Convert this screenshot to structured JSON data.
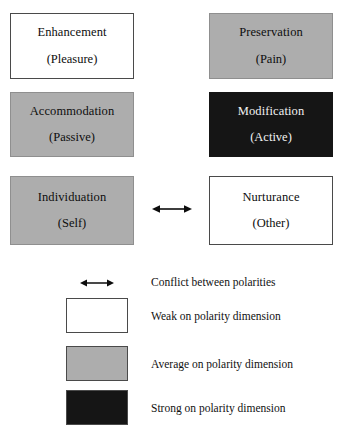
{
  "diagram": {
    "matrix": {
      "rows": [
        {
          "left": {
            "title": "Enhancement",
            "sub": "(Pleasure)",
            "fill": "weak",
            "fill_color": "#ffffff"
          },
          "right": {
            "title": "Preservation",
            "sub": "(Pain)",
            "fill": "average",
            "fill_color": "#adadad"
          }
        },
        {
          "left": {
            "title": "Accommodation",
            "sub": "(Passive)",
            "fill": "average",
            "fill_color": "#adadad"
          },
          "right": {
            "title": "Modification",
            "sub": "(Active)",
            "fill": "strong",
            "fill_color": "#151515"
          }
        },
        {
          "left": {
            "title": "Individuation",
            "sub": "(Self)",
            "fill": "average",
            "fill_color": "#adadad"
          },
          "right": {
            "title": "Nurturance",
            "sub": "(Other)",
            "fill": "weak",
            "fill_color": "#ffffff"
          }
        }
      ],
      "conflict_arrow": "double-headed-arrow-icon"
    },
    "legend": {
      "items": [
        {
          "symbol": "double-headed-arrow-icon",
          "label": "Conflict between polarities",
          "fill_color": null
        },
        {
          "symbol": "swatch",
          "label": "Weak on polarity dimension",
          "fill_color": "#ffffff"
        },
        {
          "symbol": "swatch",
          "label": "Average on polarity dimension",
          "fill_color": "#adadad"
        },
        {
          "symbol": "swatch",
          "label": "Strong on polarity dimension",
          "fill_color": "#151515"
        }
      ]
    },
    "colors": {
      "background": "#ffffff",
      "border": "#4a4a4a",
      "text": "#0d0d0d",
      "text_on_dark": "#f2f2f2"
    }
  }
}
